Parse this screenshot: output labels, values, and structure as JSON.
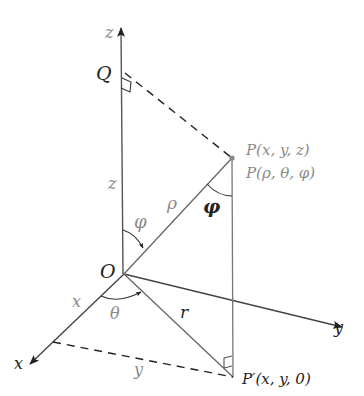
{
  "figure": {
    "colors": {
      "line": "#555555",
      "dash": "#222222",
      "label_dark": "#222222",
      "label_gray": "#8a8a8a"
    }
  },
  "axes": {
    "z_label": "z",
    "y_label": "y",
    "x_label": "x"
  },
  "points": {
    "origin": "O",
    "Q": "Q",
    "P_cartesian": "P(x, y, z)",
    "P_spherical": "P(ρ, θ, φ)",
    "P_prime": "P′(x, y, 0)"
  },
  "segment_labels": {
    "z_height": "z",
    "rho": "ρ",
    "r": "r",
    "x_length": "x",
    "y_length": "y"
  },
  "angle_labels": {
    "phi_at_origin": "φ",
    "phi_at_P": "φ",
    "theta": "θ"
  }
}
